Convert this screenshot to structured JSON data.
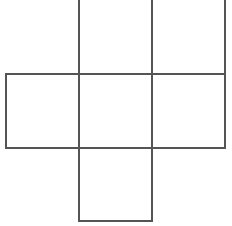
{
  "figure": {
    "name": "cube-net",
    "background_color": "#ffffff",
    "stroke_color": "#555555",
    "stroke_width": 1.5,
    "canvas": {
      "width": 232,
      "height": 226
    },
    "grid": {
      "cell_size": 73,
      "vertical_lines_x": [
        6,
        79,
        152,
        225
      ],
      "horizontal_lines_y": [
        1,
        74,
        148,
        221
      ],
      "top_row_cropped": true
    },
    "squares": [
      {
        "id": "top-middle",
        "label": "",
        "x": 79,
        "y": 1,
        "width": 73,
        "height": 73,
        "row": "top",
        "column": "middle"
      },
      {
        "id": "top-right",
        "label": "",
        "x": 152,
        "y": 1,
        "width": 73,
        "height": 73,
        "row": "top",
        "column": "right"
      },
      {
        "id": "middle-left",
        "label": "",
        "x": 6,
        "y": 74,
        "width": 73,
        "height": 74,
        "row": "middle",
        "column": "left"
      },
      {
        "id": "middle-center",
        "label": "",
        "x": 79,
        "y": 74,
        "width": 73,
        "height": 74,
        "row": "middle",
        "column": "middle"
      },
      {
        "id": "middle-right",
        "label": "",
        "x": 152,
        "y": 74,
        "width": 73,
        "height": 74,
        "row": "middle",
        "column": "right"
      },
      {
        "id": "bottom-middle",
        "label": "",
        "x": 79,
        "y": 148,
        "width": 73,
        "height": 73,
        "row": "bottom",
        "column": "middle"
      }
    ],
    "segments": [
      {
        "id": "v-left-middle",
        "orientation": "vertical",
        "x1": 6,
        "y1": 74,
        "x2": 6,
        "y2": 148
      },
      {
        "id": "v-inner-left",
        "orientation": "vertical",
        "x1": 79,
        "y1": 0,
        "x2": 79,
        "y2": 221
      },
      {
        "id": "v-inner-right",
        "orientation": "vertical",
        "x1": 152,
        "y1": 0,
        "x2": 152,
        "y2": 221
      },
      {
        "id": "v-right-outer",
        "orientation": "vertical",
        "x1": 225,
        "y1": 0,
        "x2": 225,
        "y2": 148
      },
      {
        "id": "h-upper",
        "orientation": "horizontal",
        "x1": 6,
        "y1": 74,
        "x2": 225,
        "y2": 74
      },
      {
        "id": "h-lower",
        "orientation": "horizontal",
        "x1": 6,
        "y1": 148,
        "x2": 225,
        "y2": 148
      },
      {
        "id": "h-bottom",
        "orientation": "horizontal",
        "x1": 79,
        "y1": 221,
        "x2": 152,
        "y2": 221
      }
    ]
  }
}
